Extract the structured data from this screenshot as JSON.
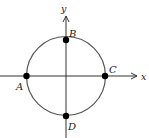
{
  "diagram": {
    "type": "unit-circle-on-axes",
    "axes": {
      "x_label": "x",
      "y_label": "y"
    },
    "circle": {
      "center": "origin",
      "stroke": "#555555"
    },
    "points": [
      {
        "id": "A",
        "label": "A",
        "position": "left intersection with x-axis"
      },
      {
        "id": "B",
        "label": "B",
        "position": "top intersection with y-axis"
      },
      {
        "id": "C",
        "label": "C",
        "position": "right intersection with x-axis"
      },
      {
        "id": "D",
        "label": "D",
        "position": "bottom intersection with y-axis"
      }
    ],
    "colors": {
      "axis": "#333333",
      "circle": "#555555",
      "point": "#000000",
      "text": "#1a1a1a"
    }
  }
}
